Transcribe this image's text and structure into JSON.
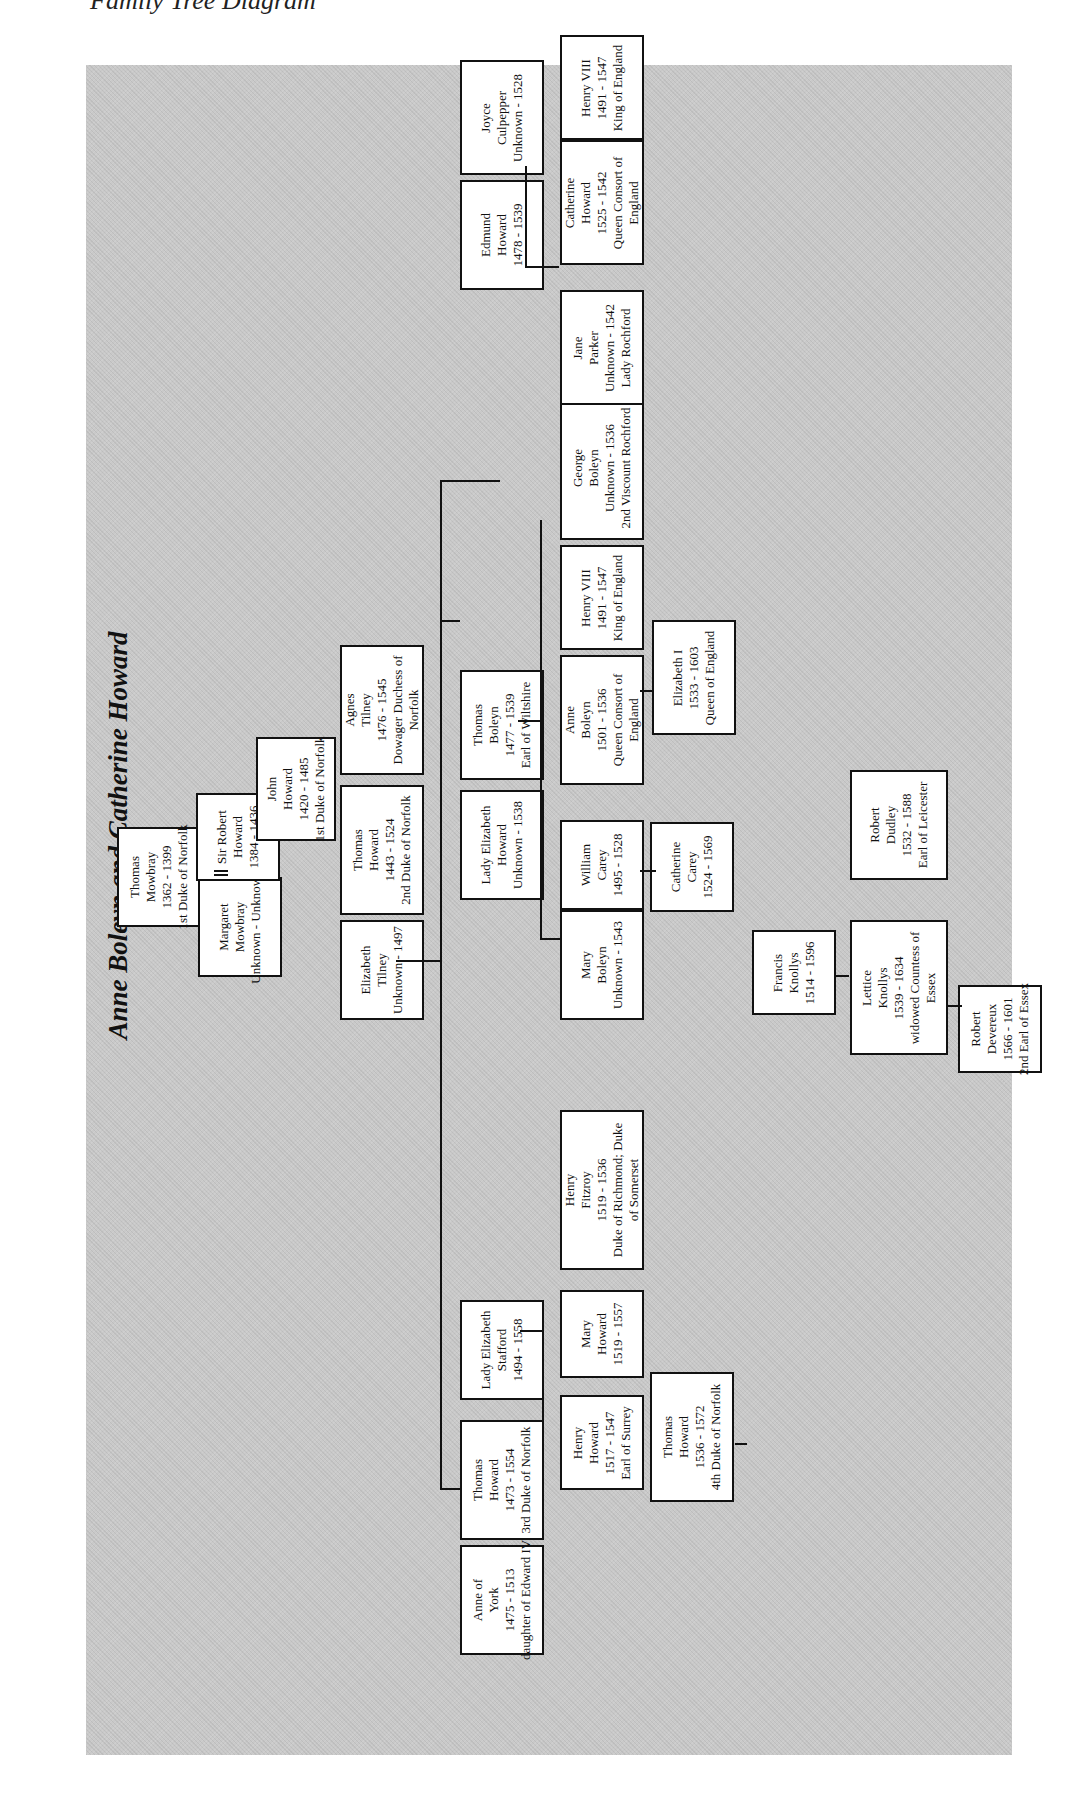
{
  "caption": "Family Tree Diagram",
  "diagram": {
    "title": "Anne Boleyn and Catherine Howard",
    "people": [
      {
        "id": "thomas-mowbray",
        "lines": [
          "Thomas",
          "Mowbray",
          "1362 - 1399",
          "1st Duke of Norfolk"
        ]
      },
      {
        "id": "margaret-mowbray",
        "lines": [
          "Margaret",
          "Mowbray",
          "Unknown - Unknown"
        ]
      },
      {
        "id": "sir-robert-howard",
        "lines": [
          "Sir Robert",
          "Howard",
          "1384 - 1436"
        ]
      },
      {
        "id": "john-howard",
        "lines": [
          "John",
          "Howard",
          "1420 - 1485",
          "1st Duke of Norfolk"
        ]
      },
      {
        "id": "elizabeth-tilney",
        "lines": [
          "Elizabeth",
          "Tilney",
          "Unknown - 1497"
        ]
      },
      {
        "id": "thomas-howard-2nd",
        "lines": [
          "Thomas",
          "Howard",
          "1443 - 1524",
          "2nd Duke of Norfolk"
        ]
      },
      {
        "id": "agnes-tilney",
        "lines": [
          "Agnes",
          "Tilney",
          "1476 - 1545",
          "Dowager Duchess of",
          "Norfolk"
        ]
      },
      {
        "id": "anne-of-york",
        "lines": [
          "Anne of",
          "York",
          "1475 - 1513",
          "daughter of Edward IV"
        ]
      },
      {
        "id": "thomas-howard-3rd",
        "lines": [
          "Thomas",
          "Howard",
          "1473 - 1554",
          "3rd Duke of Norfolk"
        ]
      },
      {
        "id": "lady-elizabeth-stafford",
        "lines": [
          "Lady Elizabeth",
          "Stafford",
          "1494 - 1558"
        ]
      },
      {
        "id": "lady-elizabeth-howard",
        "lines": [
          "Lady Elizabeth",
          "Howard",
          "Unknown - 1538"
        ]
      },
      {
        "id": "thomas-boleyn",
        "lines": [
          "Thomas",
          "Boleyn",
          "1477 - 1539",
          "Earl of Wiltshire"
        ]
      },
      {
        "id": "edmund-howard",
        "lines": [
          "Edmund",
          "Howard",
          "1478 - 1539"
        ]
      },
      {
        "id": "joyce-culpepper",
        "lines": [
          "Joyce",
          "Culpepper",
          "Unknown - 1528"
        ]
      },
      {
        "id": "henry-howard",
        "lines": [
          "Henry",
          "Howard",
          "1517 - 1547",
          "Earl of Surrey"
        ]
      },
      {
        "id": "mary-howard",
        "lines": [
          "Mary",
          "Howard",
          "1519 - 1557"
        ]
      },
      {
        "id": "henry-fitzroy",
        "lines": [
          "Henry",
          "Fitzroy",
          "1519 - 1536",
          "Duke of Richmond; Duke",
          "of Somerset"
        ]
      },
      {
        "id": "thomas-howard-4th",
        "lines": [
          "Thomas",
          "Howard",
          "1536 - 1572",
          "4th Duke of Norfolk"
        ]
      },
      {
        "id": "mary-boleyn",
        "lines": [
          "Mary",
          "Boleyn",
          "Unknown - 1543"
        ]
      },
      {
        "id": "william-carey",
        "lines": [
          "William",
          "Carey",
          "1495 - 1528"
        ]
      },
      {
        "id": "anne-boleyn",
        "lines": [
          "Anne",
          "Boleyn",
          "1501 - 1536",
          "Queen Consort of",
          "England"
        ]
      },
      {
        "id": "henry-viii-a",
        "lines": [
          "Henry VIII",
          "1491 - 1547",
          "King of England"
        ]
      },
      {
        "id": "george-boleyn",
        "lines": [
          "George",
          "Boleyn",
          "Unknown - 1536",
          "2nd Viscount Rochford"
        ]
      },
      {
        "id": "jane-parker",
        "lines": [
          "Jane",
          "Parker",
          "Unknown - 1542",
          "Lady Rochford"
        ]
      },
      {
        "id": "catherine-howard",
        "lines": [
          "Catherine",
          "Howard",
          "1525 - 1542",
          "Queen Consort of",
          "England"
        ]
      },
      {
        "id": "henry-viii-b",
        "lines": [
          "Henry VIII",
          "1491 - 1547",
          "King of England"
        ]
      },
      {
        "id": "elizabeth-i",
        "lines": [
          "Elizabeth I",
          "1533 - 1603",
          "Queen of England"
        ]
      },
      {
        "id": "francis-knollys",
        "lines": [
          "Francis",
          "Knollys",
          "1514 - 1596"
        ]
      },
      {
        "id": "catherine-carey",
        "lines": [
          "Catherine",
          "Carey",
          "1524 - 1569"
        ]
      },
      {
        "id": "lettice-knollys",
        "lines": [
          "Lettice",
          "Knollys",
          "1539 - 1634",
          "widowed Countess of",
          "Essex"
        ]
      },
      {
        "id": "robert-dudley",
        "lines": [
          "Robert",
          "Dudley",
          "1532 - 1588",
          "Earl of Leicester"
        ]
      },
      {
        "id": "robert-devereux",
        "lines": [
          "Robert",
          "Devereux",
          "1566 - 1601",
          "2nd Earl of Essex"
        ]
      }
    ]
  }
}
